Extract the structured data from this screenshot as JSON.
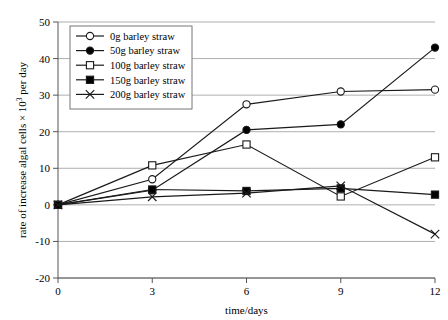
{
  "chart_data": {
    "type": "line",
    "title": "",
    "subtitle": "",
    "xlabel": "time/days",
    "ylabel": "rate of increase algal cells × 10³ per day",
    "ylabel_parts": {
      "pre": "rate of increase algal cells × 10",
      "exponent": "3",
      "post": " per day"
    },
    "x": [
      0,
      3,
      6,
      9,
      12
    ],
    "xticks": [
      "0",
      "3",
      "6",
      "9",
      "12"
    ],
    "yticks": [
      "50",
      "40",
      "30",
      "20",
      "10",
      "0",
      "-10",
      "-20"
    ],
    "ytick_values": [
      50,
      40,
      30,
      20,
      10,
      0,
      -10,
      -20
    ],
    "xlim": [
      0,
      12
    ],
    "ylim": [
      -20,
      50
    ],
    "grid": "horizontal",
    "legend_position": "top-left inside",
    "series": [
      {
        "name": "0g barley straw",
        "marker": "open-circle",
        "values": [
          0,
          7,
          27.5,
          31,
          31.5
        ]
      },
      {
        "name": "50g barley straw",
        "marker": "filled-circle",
        "values": [
          0,
          4,
          20.5,
          22,
          43
        ]
      },
      {
        "name": "100g barley straw",
        "marker": "open-square",
        "values": [
          0,
          10.8,
          16.5,
          2.3,
          13
        ]
      },
      {
        "name": "150g barley straw",
        "marker": "filled-square",
        "values": [
          0,
          4.2,
          3.8,
          4.5,
          2.8
        ]
      },
      {
        "name": "200g barley straw",
        "marker": "cross",
        "values": [
          0,
          2.2,
          3.2,
          5.2,
          -8
        ]
      }
    ],
    "colors": {
      "line": "#1a1a1a",
      "grid": "#9a9a9a",
      "axis": "#555555",
      "marker_fill_open": "#ffffff",
      "marker_fill_closed": "#000000",
      "background": "#ffffff",
      "legend_border": "#777777"
    }
  }
}
